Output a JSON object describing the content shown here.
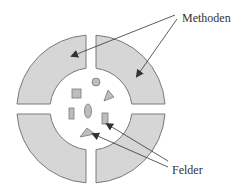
{
  "diagram": {
    "type": "object-encapsulation",
    "labels": {
      "methods": "Methoden",
      "fields": "Felder"
    },
    "colors": {
      "segment_fill": "#d6d6d6",
      "segment_stroke": "#7a7a7a",
      "shape_fill": "#bdbdbd",
      "shape_stroke": "#7a7a7a",
      "arrow": "#333333",
      "text": "#333333"
    },
    "ring": {
      "segments": [
        "top-left",
        "top-right",
        "bottom-left",
        "bottom-right"
      ],
      "segment_count": 4
    },
    "fields": [
      "circle",
      "square",
      "triangle",
      "rectangle",
      "ellipse",
      "rectangle",
      "triangle"
    ]
  }
}
